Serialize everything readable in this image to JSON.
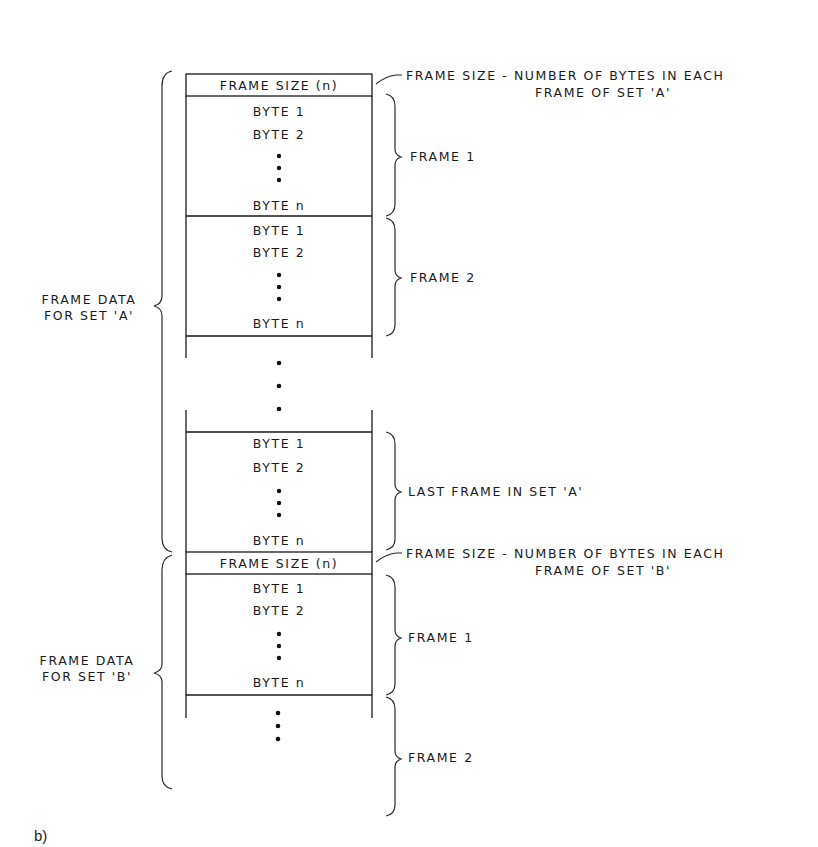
{
  "figure": {
    "caption": "b)",
    "box": {
      "frame_size_label": "FRAME SIZE (n)",
      "byte_first": "BYTE 1",
      "byte_second": "BYTE 2",
      "byte_last": "BYTE n",
      "ellipsis": "⋮"
    },
    "left_labels": {
      "set_a_line1": "FRAME DATA",
      "set_a_line2": "FOR SET 'A'",
      "set_b_line1": "FRAME DATA",
      "set_b_line2": "FOR SET 'B'"
    },
    "right_labels": {
      "frame_size_a_line1": "FRAME SIZE - NUMBER OF BYTES IN EACH",
      "frame_size_a_line2": "FRAME OF SET 'A'",
      "set_a_frame1": "FRAME 1",
      "set_a_frame2": "FRAME 2",
      "set_a_last_frame": "LAST FRAME IN SET 'A'",
      "frame_size_b_line1": "FRAME SIZE - NUMBER OF BYTES IN EACH",
      "frame_size_b_line2": "FRAME OF SET 'B'",
      "set_b_frame1": "FRAME 1",
      "set_b_frame2": "FRAME 2"
    },
    "colors": {
      "ink": "#1a1a1a",
      "background": "#ffffff"
    }
  }
}
